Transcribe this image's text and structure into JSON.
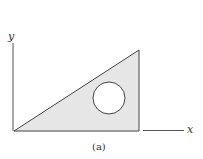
{
  "figure": {
    "caption": "(a)",
    "x_axis_label": "x",
    "y_axis_label": "y",
    "colors": {
      "fill": "#e6e6e6",
      "stroke": "#444444",
      "background": "#ffffff"
    },
    "shapes": {
      "triangle": {
        "points": [
          [
            14,
            131
          ],
          [
            139,
            50
          ],
          [
            139,
            131
          ]
        ]
      },
      "hole_circle": {
        "cx": 109,
        "cy": 98,
        "r": 16
      }
    }
  }
}
